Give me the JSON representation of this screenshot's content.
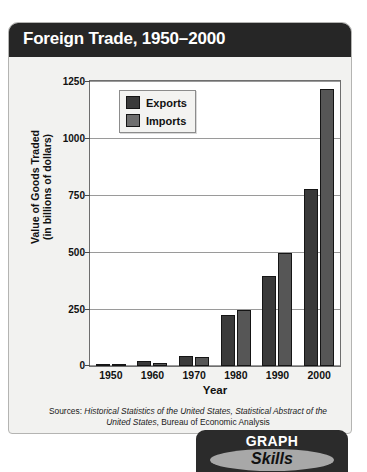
{
  "header": {
    "title": "Foreign Trade, 1950–2000"
  },
  "badge": {
    "line1": "GRAPH",
    "line2": "Skills"
  },
  "sources": {
    "prefix": "Sources: ",
    "italic1": "Historical Statistics of the United States, Statistical Abstract of the United States",
    "suffix": ", Bureau of Economic Analysis"
  },
  "colors": {
    "exports": "#3a3a3a",
    "imports": "#565656",
    "header_bg": "#262626",
    "card_bg": "#f2f2f0",
    "plot_bg": "#ffffff",
    "gridline": "#9a9a9a"
  },
  "chart_data": {
    "type": "bar",
    "title": "Foreign Trade, 1950–2000",
    "xlabel": "Year",
    "ylabel": "Value of Goods Traded (in billions of dollars)",
    "ylabel_line1": "Value of  Goods Traded",
    "ylabel_line2": "(in billions of dollars)",
    "categories": [
      "1950",
      "1960",
      "1970",
      "1980",
      "1990",
      "2000"
    ],
    "series": [
      {
        "name": "Exports",
        "values": [
          10,
          20,
          43,
          225,
          393,
          775
        ]
      },
      {
        "name": "Imports",
        "values": [
          9,
          15,
          40,
          245,
          495,
          1215
        ]
      }
    ],
    "ylim": [
      0,
      1250
    ],
    "yticks": [
      0,
      250,
      500,
      750,
      1000,
      1250
    ],
    "ytick_labels": [
      "0",
      "250",
      "500",
      "750",
      "1000",
      "1250"
    ],
    "grid": true,
    "legend_position": "top-left"
  }
}
